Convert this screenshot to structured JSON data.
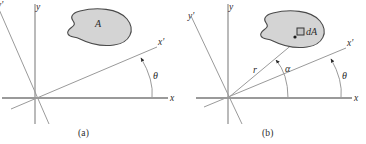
{
  "figure": {
    "type": "diagram",
    "panels": [
      {
        "id": "a",
        "caption": "(a)",
        "axis_labels": {
          "x": "x",
          "y": "y",
          "x_prime": "x'",
          "y_prime": "y'"
        },
        "annotations": [
          {
            "name": "area-label",
            "text": "A"
          },
          {
            "name": "theta-angle-label",
            "text": "θ"
          }
        ]
      },
      {
        "id": "b",
        "caption": "(b)",
        "axis_labels": {
          "x": "x",
          "y": "y",
          "x_prime": "x'",
          "y_prime": "y'"
        },
        "annotations": [
          {
            "name": "differential-area-label",
            "text": "dA"
          },
          {
            "name": "radius-label",
            "text": "r"
          },
          {
            "name": "alpha-angle-label",
            "text": "α"
          },
          {
            "name": "theta-angle-label",
            "text": "θ"
          }
        ]
      }
    ],
    "colors": {
      "axis_stroke": "#8c8c8c",
      "x_axis_stroke": "#9a9a9a",
      "blob_fill": "#d4d4d4",
      "blob_stroke": "#4a4a4a",
      "text": "#2b2b2b",
      "arc_stroke": "#9a9a9a",
      "background": "#ffffff"
    }
  }
}
